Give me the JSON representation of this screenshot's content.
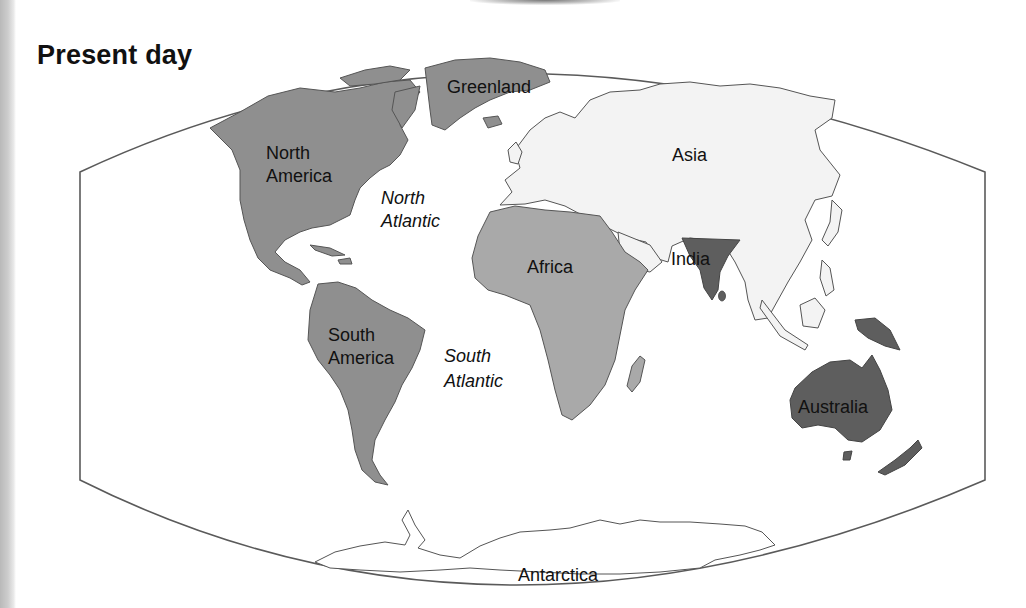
{
  "title": "Present day",
  "map": {
    "projection_frame": "world map, curved-edge projection",
    "colors": {
      "americas_greenland": "#8f8f8f",
      "africa": "#a9a9a9",
      "eurasia": "#f3f3f3",
      "india": "#5e5e5e",
      "australia": "#5e5e5e",
      "antarctica": "#ffffff",
      "outline": "#555555",
      "frame": "#5a5a5a"
    },
    "labels": {
      "greenland": "Greenland",
      "north_america_1": "North",
      "north_america_2": "America",
      "north_atlantic_1": "North",
      "north_atlantic_2": "Atlantic",
      "asia": "Asia",
      "africa": "Africa",
      "india": "India",
      "south_america_1": "South",
      "south_america_2": "America",
      "south_atlantic_1": "South",
      "south_atlantic_2": "Atlantic",
      "australia": "Australia",
      "antarctica": "Antarctica"
    }
  }
}
